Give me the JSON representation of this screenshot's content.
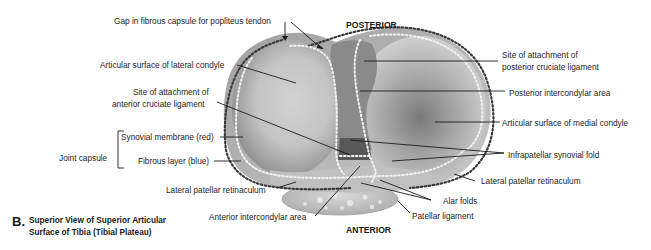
{
  "figure": {
    "panel_letter": "B.",
    "caption_line1": "Superior View of Superior Articular",
    "caption_line2": "Surface of Tibia (Tibial Plateau)",
    "orientation": {
      "top": "POSTERIOR",
      "bottom": "ANTERIOR"
    }
  },
  "labels": {
    "gap_fibrous_capsule": "Gap in fibrous capsule for popliteus tendon",
    "articular_surface_lateral": "Articular surface of lateral condyle",
    "acl_attachment_line1": "Site of attachment of",
    "acl_attachment_line2": "anterior cruciate ligament",
    "joint_capsule": "Joint capsule",
    "synovial_membrane": "Synovial membrane (red)",
    "fibrous_layer": "Fibrous layer (blue)",
    "lateral_patellar_retinaculum_left": "Lateral patellar retinaculum",
    "anterior_intercondylar_area": "Anterior intercondylar area",
    "pcl_attachment_line1": "Site of attachment of",
    "pcl_attachment_line2": "posterior cruciate ligament",
    "posterior_intercondylar_area": "Posterior intercondylar area",
    "articular_surface_medial": "Articular surface of medial condyle",
    "infrapatellar_synovial_fold": "Infrapatellar synovial fold",
    "lateral_patellar_retinaculum_right": "Lateral patellar retinaculum",
    "alar_folds": "Alar folds",
    "patellar_ligament": "Patellar ligament"
  },
  "colors": {
    "text": "#1e1e1e",
    "leader_line": "#1a1a1a",
    "bone_light": "#e6e6e6",
    "bone_mid": "#b4b4b4",
    "bone_dark": "#6e6e6e",
    "dotted_outline_dark": "#3a3a3a",
    "dotted_outline_light": "#f4f4f4"
  }
}
